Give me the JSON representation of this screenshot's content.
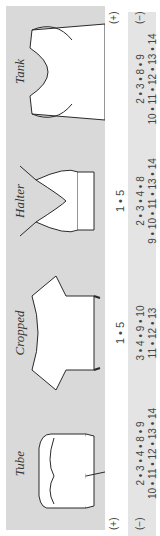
{
  "legend": {
    "plus": "(+)",
    "minus": "(−)"
  },
  "garments": [
    {
      "name": "Tube",
      "mid_label": "",
      "sizes_top": "2 • 3 • 4 • 8 • 9",
      "sizes_bottom": "10 • 11 • 12 • 13 • 14"
    },
    {
      "name": "Cropped",
      "mid_label": "1 • 5",
      "sizes_top": "3 • 4 • 9 • 10",
      "sizes_bottom": "11 • 12 • 13"
    },
    {
      "name": "Halter",
      "mid_label": "1 • 5",
      "sizes_top": "2 • 3 • 4 • 8",
      "sizes_bottom": "9 • 10 • 11 • 13 • 14"
    },
    {
      "name": "Tank",
      "mid_label": "",
      "sizes_top": "2 • 3 • 8 • 9",
      "sizes_bottom": "10 • 11 • 12 • 13 • 14"
    }
  ],
  "colors": {
    "panel": "#d9d9d9",
    "band": "#e4e4e4",
    "line": "#2a2a2a"
  }
}
